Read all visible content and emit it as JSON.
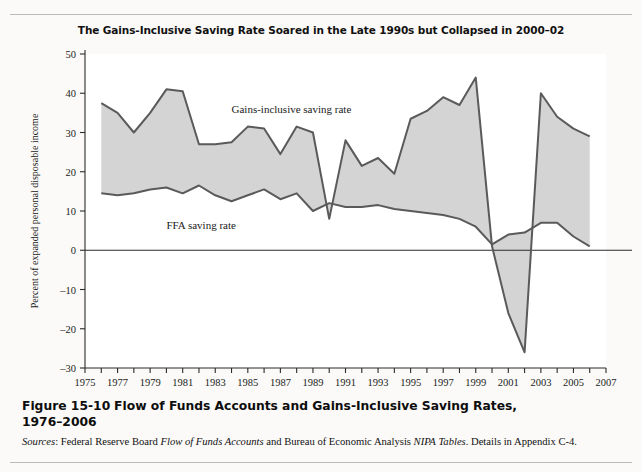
{
  "figure": {
    "chart_title": "The Gains-Inclusive Saving Rate Soared in the Late 1990s but Collapsed in 2000–02",
    "caption_number": "Figure 15-10",
    "caption_text": "Flow of Funds Accounts and Gains-Inclusive Saving Rates,",
    "caption_text_line2": "1976–2006",
    "sources_label": "Sources",
    "sources_text_1": ": Federal Reserve Board ",
    "sources_italic_1": "Flow of Funds Accounts",
    "sources_text_2": " and Bureau of Economic Analysis ",
    "sources_italic_2": "NIPA",
    "sources_italic_3": "Tables",
    "sources_text_3": ". Details in Appendix C-4."
  },
  "colors": {
    "area_fill": "#d4d4d4",
    "line": "#5a5a5a",
    "axis": "#2b2b2b",
    "page_bg": "#fbfaf8",
    "plot_bg": "#ffffff"
  },
  "chart_data": {
    "type": "line",
    "title": "The Gains-Inclusive Saving Rate Soared in the Late 1990s but Collapsed in 2000–02",
    "xlabel": "",
    "ylabel": "Percent of expanded personal disposable income",
    "xlim": [
      1975,
      2007
    ],
    "ylim": [
      -30,
      50
    ],
    "ytick_step": 10,
    "yticks": [
      -30,
      -20,
      -10,
      0,
      10,
      20,
      30,
      40,
      50
    ],
    "xticks": [
      1975,
      1976,
      1977,
      1978,
      1979,
      1980,
      1981,
      1982,
      1983,
      1984,
      1985,
      1986,
      1987,
      1988,
      1989,
      1990,
      1991,
      1992,
      1993,
      1994,
      1995,
      1996,
      1997,
      1998,
      1999,
      2000,
      2001,
      2002,
      2003,
      2004,
      2005,
      2006,
      2007
    ],
    "xtick_labels": [
      1975,
      1977,
      1979,
      1981,
      1983,
      1985,
      1987,
      1989,
      1991,
      1993,
      1995,
      1997,
      1999,
      2001,
      2003,
      2005,
      2007
    ],
    "grid": false,
    "legend_position": "inline-annotation",
    "zero_line": true,
    "x": [
      1976,
      1977,
      1978,
      1979,
      1980,
      1981,
      1982,
      1983,
      1984,
      1985,
      1986,
      1987,
      1988,
      1989,
      1990,
      1991,
      1992,
      1993,
      1994,
      1995,
      1996,
      1997,
      1998,
      1999,
      2000,
      2001,
      2002,
      2003,
      2004,
      2005,
      2006
    ],
    "series": [
      {
        "name": "Gains-inclusive saving rate",
        "label": "Gains-inclusive saving rate",
        "values": [
          37.5,
          35,
          30,
          35,
          41,
          40.5,
          27,
          27,
          27.5,
          31.5,
          31,
          24.5,
          31.5,
          30,
          8,
          28,
          21.5,
          23.5,
          19.5,
          33.5,
          35.5,
          39,
          37,
          44,
          1,
          -16,
          -26,
          40,
          34,
          31,
          29
        ]
      },
      {
        "name": "FFA saving rate",
        "label": "FFA saving rate",
        "values": [
          14.5,
          14,
          14.5,
          15.5,
          16,
          14.5,
          16.5,
          14,
          12.5,
          14,
          15.5,
          13,
          14.5,
          10,
          12,
          11,
          11,
          11.5,
          10.5,
          10,
          9.5,
          9,
          8,
          6,
          1.5,
          4,
          4.5,
          7,
          7,
          3.5,
          1
        ]
      }
    ],
    "annotations": [
      {
        "text": "Gains-inclusive saving rate",
        "x": 1984.0,
        "y": 35.0
      },
      {
        "text": "FFA saving rate",
        "x": 1980.0,
        "y": 5.5
      }
    ]
  }
}
